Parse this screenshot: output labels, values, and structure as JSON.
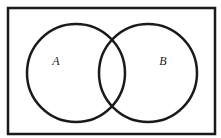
{
  "diagram": {
    "type": "venn",
    "universe": {
      "x": 8,
      "y": 8,
      "width": 207,
      "height": 126,
      "stroke": "#1a1a1a",
      "stroke_width": 2.5
    },
    "sets": [
      {
        "label": "A",
        "cx": 76,
        "cy": 73,
        "r": 49,
        "label_x": 56,
        "label_y": 65
      },
      {
        "label": "B",
        "cx": 148,
        "cy": 73,
        "r": 49,
        "label_x": 163,
        "label_y": 65
      }
    ],
    "circle_stroke": "#1a1a1a",
    "circle_stroke_width": 2.5
  }
}
